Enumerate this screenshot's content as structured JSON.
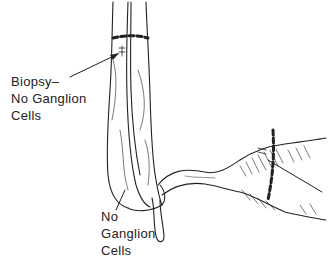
{
  "figure": {
    "labels": {
      "upper": {
        "lines": [
          "Biopsy–",
          "No Ganglion",
          "Cells"
        ]
      },
      "lower": {
        "lines": [
          "No",
          "Ganglion",
          "Cells"
        ]
      }
    },
    "colors": {
      "ink": "#222222",
      "background": "#ffffff"
    }
  }
}
